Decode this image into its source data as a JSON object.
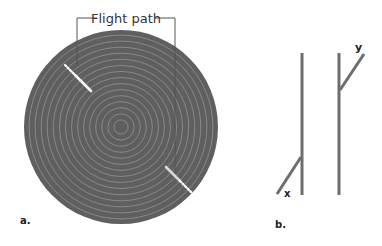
{
  "panel_a": {
    "label": "a.",
    "flight_path_label": "Flight path",
    "circle": {
      "cx": 121,
      "cy": 127,
      "r": 97,
      "fill": "#5f5f5f",
      "ring_color": "#8a8a8a",
      "ring_count": 16
    },
    "flight_path_segments": [
      {
        "dotted": [
          [
            65,
            65
          ],
          [
            75,
            75
          ]
        ],
        "solid": [
          [
            75,
            75
          ],
          [
            91,
            91
          ]
        ]
      },
      {
        "solid": [
          [
            166,
            167
          ],
          [
            180,
            181
          ]
        ],
        "dotted": [
          [
            180,
            181
          ],
          [
            192,
            193
          ]
        ]
      }
    ]
  },
  "panel_b": {
    "label": "b.",
    "line_color": "#6e6e6e",
    "lines": [
      {
        "name": "x",
        "label": "x",
        "vertical": [
          302,
          53,
          302,
          195
        ],
        "branch": [
          277,
          194,
          301,
          156
        ]
      },
      {
        "name": "y",
        "label": "y",
        "vertical": [
          339,
          53,
          339,
          195
        ],
        "branch": [
          340,
          90,
          364,
          54
        ]
      }
    ]
  }
}
